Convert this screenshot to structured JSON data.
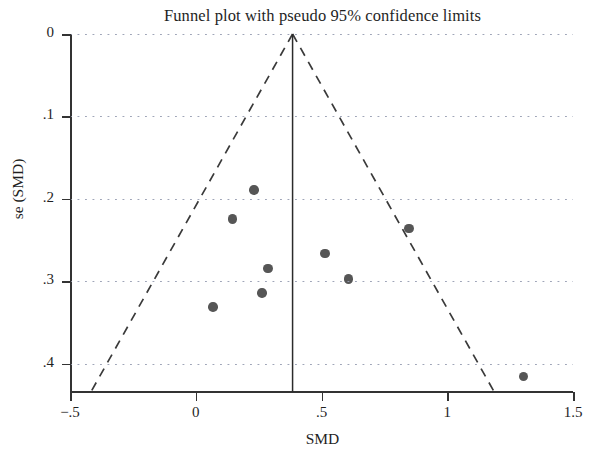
{
  "chart_data": {
    "type": "scatter",
    "title": "Funnel plot with pseudo 95% confidence limits",
    "xlabel": "SMD",
    "ylabel": "se (SMD)",
    "xlim": [
      -0.5,
      1.5
    ],
    "ylim": [
      0.0,
      0.434
    ],
    "y_axis_inverted": true,
    "grid": "horizontal dotted at y ticks",
    "legend": "none",
    "xticks": [
      -0.5,
      0,
      0.5,
      1,
      1.5
    ],
    "xticklabels": [
      "−.5",
      "0",
      ".5",
      "1",
      "1.5"
    ],
    "yticks": [
      0,
      0.1,
      0.2,
      0.3,
      0.4
    ],
    "yticklabels": [
      "0",
      ".1",
      ".2",
      ".3",
      ".4"
    ],
    "pooled_effect": 0.385,
    "pooled_line_style": "solid vertical",
    "pseudo_ci_line_style": "dashed",
    "pseudo_ci_apex": {
      "smd": 0.385,
      "se": 0.0
    },
    "pseudo_ci_left_end": {
      "smd": -0.417,
      "se": 0.434
    },
    "pseudo_ci_right_end": {
      "smd": 1.187,
      "se": 0.434
    },
    "marker_color": "#565656",
    "points": [
      {
        "smd": 0.231,
        "se": 0.189
      },
      {
        "smd": 0.146,
        "se": 0.224
      },
      {
        "smd": 0.514,
        "se": 0.266
      },
      {
        "smd": 0.287,
        "se": 0.284
      },
      {
        "smd": 0.848,
        "se": 0.236
      },
      {
        "smd": 0.607,
        "se": 0.297
      },
      {
        "smd": 0.263,
        "se": 0.314
      },
      {
        "smd": 0.069,
        "se": 0.331
      },
      {
        "smd": 1.304,
        "se": 0.415
      }
    ],
    "n_studies": 9
  }
}
